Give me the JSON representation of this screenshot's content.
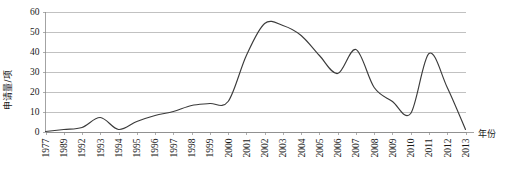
{
  "chart_data": {
    "type": "line",
    "title": "",
    "subtitle": "",
    "xlabel": "年份",
    "ylabel": "申请量/项",
    "xlim": [
      0,
      23
    ],
    "ylim": [
      0,
      60
    ],
    "ytick_step": 10,
    "yticks": [
      "60",
      "50",
      "40",
      "30",
      "20",
      "10",
      "0"
    ],
    "grid": true,
    "legend": false,
    "legend_position": "none",
    "line_color": "#3b3b3b",
    "grid_color": "#a6a6a6",
    "background_color": "#ffffff",
    "categories": [
      "1977",
      "1989",
      "1992",
      "1993",
      "1994",
      "1995",
      "1996",
      "1997",
      "1998",
      "1999",
      "2000",
      "2001",
      "2002",
      "2003",
      "2004",
      "2005",
      "2006",
      "2007",
      "2008",
      "2009",
      "2010",
      "2011",
      "2012",
      "2013"
    ],
    "series": [
      {
        "name": "申请量",
        "values": [
          0,
          1,
          2,
          7,
          1,
          5,
          8,
          10,
          13,
          14,
          15,
          38,
          54,
          53,
          48,
          38,
          29,
          41,
          22,
          15,
          9,
          39,
          22,
          1
        ]
      }
    ]
  }
}
